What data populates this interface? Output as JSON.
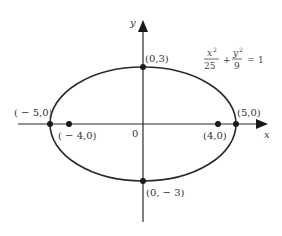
{
  "diagram": {
    "type": "ellipse-on-axes",
    "equation": {
      "term1_num": "x",
      "term1_exp": "2",
      "term1_den": "25",
      "plus": "+",
      "term2_num": "y",
      "term2_exp": "2",
      "term2_den": "9",
      "equals": "=",
      "rhs": "1"
    },
    "axes": {
      "x_label": "x",
      "y_label": "y",
      "origin_label": "0"
    },
    "points": {
      "top_vertex": "(0,3)",
      "bottom_vertex": "(0, − 3)",
      "left_vertex": "( − 5,0)",
      "right_vertex": "(5,0)",
      "left_focus": "( − 4,0)",
      "right_focus": "(4,0)"
    },
    "geometry": {
      "center": [
        0,
        0
      ],
      "semi_major": 5,
      "semi_minor": 3,
      "foci": [
        [
          -4,
          0
        ],
        [
          4,
          0
        ]
      ]
    },
    "colors": {
      "stroke": "#2a2a2a",
      "text": "#333333",
      "background": "#ffffff"
    }
  }
}
